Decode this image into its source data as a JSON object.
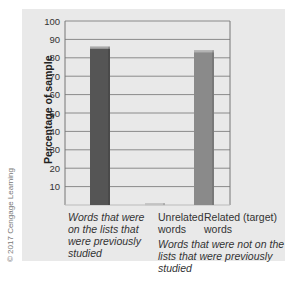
{
  "chart_data": {
    "type": "bar",
    "title": "",
    "xlabel": "",
    "ylabel": "Percentage of sample",
    "ylim": [
      0,
      100
    ],
    "yticks": [
      10,
      20,
      30,
      40,
      50,
      60,
      70,
      80,
      90,
      100
    ],
    "grid": true,
    "categories": [
      "Words that were on the lists that were previously studied",
      "Unrelated words",
      "Related (target) words"
    ],
    "values": [
      86,
      1,
      84
    ],
    "bar_colors": [
      "#555555",
      "#d8d8d8",
      "#8a8a8a"
    ],
    "group_annotation": "Words that were not on the lists that were previously studied",
    "category_labels": [
      {
        "lines": [
          "Words that were",
          "on the lists that",
          "were previously",
          "studied"
        ],
        "italic": true
      },
      {
        "lines": [
          "Unrelated",
          "words"
        ],
        "italic": false
      },
      {
        "lines": [
          "Related (target)",
          "words"
        ],
        "italic": false
      }
    ],
    "group_annotation_lines": [
      "Words that were not on the",
      "lists that were previously studied"
    ]
  },
  "credit": "© 2017 Cengage Learning"
}
